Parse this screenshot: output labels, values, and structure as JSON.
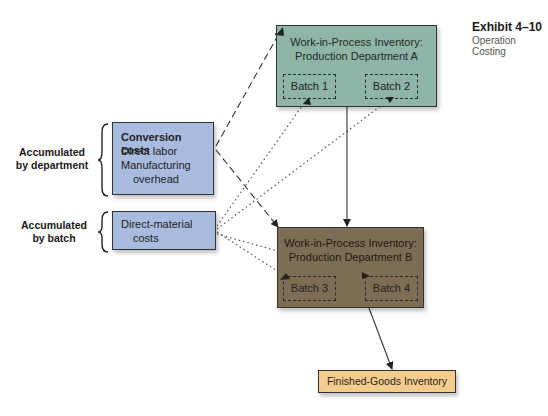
{
  "exhibit": {
    "number": "Exhibit 4–10",
    "title": "Operation Costing"
  },
  "side_labels": {
    "department": [
      "Accumulated",
      "by department"
    ],
    "batch": [
      "Accumulated",
      "by batch"
    ]
  },
  "sources": {
    "conversion": {
      "heading": "Conversion costs",
      "lines": [
        "Direct labor",
        "Manufacturing",
        "overhead"
      ]
    },
    "direct_material": {
      "lines": [
        "Direct-material",
        "costs"
      ]
    }
  },
  "departments": [
    {
      "title_line1": "Work-in-Process Inventory:",
      "title_line2": "Production Department A",
      "color": "#8fb5a8",
      "batches": [
        "Batch 1",
        "Batch 2"
      ]
    },
    {
      "title_line1": "Work-in-Process Inventory:",
      "title_line2": "Production Department B",
      "color": "#7d6d54",
      "batches": [
        "Batch 3",
        "Batch 4"
      ]
    }
  ],
  "finished_goods": {
    "label": "Finished-Goods Inventory",
    "color": "#f4cc8e"
  },
  "colors": {
    "source_box": "#a9bbdf"
  },
  "flows": [
    {
      "from": "Conversion costs",
      "to": "Production Department A",
      "style": "dashed"
    },
    {
      "from": "Conversion costs",
      "to": "Production Department B",
      "style": "dashed"
    },
    {
      "from": "Direct-material costs",
      "to": "Batch 1",
      "style": "dotted"
    },
    {
      "from": "Direct-material costs",
      "to": "Batch 2",
      "style": "dotted"
    },
    {
      "from": "Direct-material costs",
      "to": "Batch 3",
      "style": "dotted"
    },
    {
      "from": "Direct-material costs",
      "to": "Batch 4",
      "style": "dotted"
    },
    {
      "from": "Production Department A",
      "to": "Production Department B",
      "style": "solid"
    },
    {
      "from": "Production Department B",
      "to": "Finished-Goods Inventory",
      "style": "solid"
    }
  ]
}
